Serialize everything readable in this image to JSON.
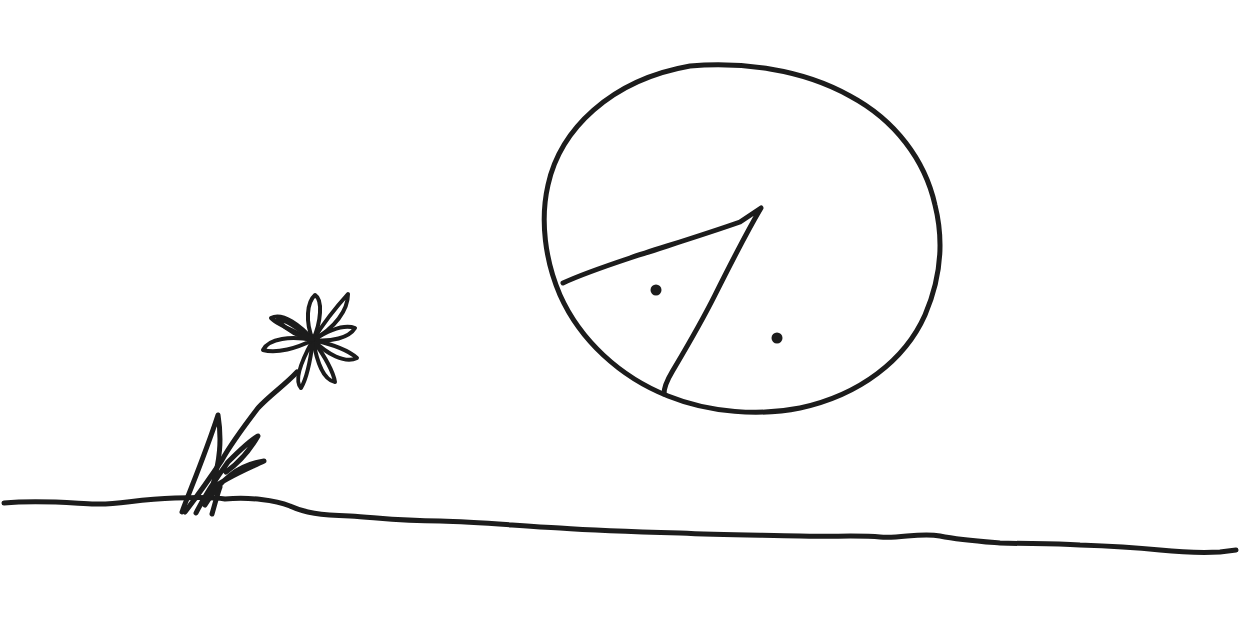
{
  "scene": {
    "description": "Hand-drawn black ink sketch on white paper",
    "background": "#ffffff",
    "ink_color": "#1c1c1c",
    "elements": [
      {
        "name": "ground-line",
        "type": "wavy-horizontal-line"
      },
      {
        "name": "flower",
        "type": "daisy-with-leaning-stem-and-grass"
      },
      {
        "name": "circle",
        "type": "large-circle-with-wedge-and-two-dots"
      }
    ]
  }
}
